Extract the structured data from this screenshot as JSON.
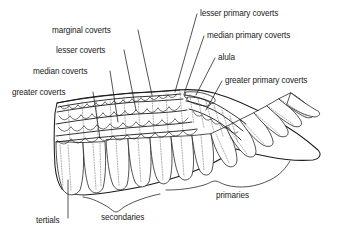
{
  "diagram": {
    "background_color": "#ffffff",
    "ink_color": "#1a1a1a",
    "labels_left": [
      {
        "id": "marginal-coverts",
        "text": "marginal coverts",
        "x": 52,
        "y": 33
      },
      {
        "id": "lesser-coverts",
        "text": "lesser coverts",
        "x": 56,
        "y": 53
      },
      {
        "id": "median-coverts",
        "text": "median coverts",
        "x": 33,
        "y": 74
      },
      {
        "id": "greater-coverts",
        "text": "greater coverts",
        "x": 12,
        "y": 95
      }
    ],
    "labels_right": [
      {
        "id": "lesser-primary-coverts",
        "text": "lesser primary coverts",
        "x": 200,
        "y": 16
      },
      {
        "id": "median-primary-coverts",
        "text": "median primary coverts",
        "x": 207,
        "y": 38
      },
      {
        "id": "alula",
        "text": "alula",
        "x": 218,
        "y": 60
      },
      {
        "id": "greater-primary-coverts",
        "text": "greater primary coverts",
        "x": 225,
        "y": 83
      }
    ],
    "labels_bottom": [
      {
        "id": "tertials",
        "text": "tertials",
        "x": 36,
        "y": 223
      },
      {
        "id": "secondaries",
        "text": "secondaries",
        "x": 101,
        "y": 220
      },
      {
        "id": "primaries",
        "text": "primaries",
        "x": 216,
        "y": 198
      }
    ]
  }
}
